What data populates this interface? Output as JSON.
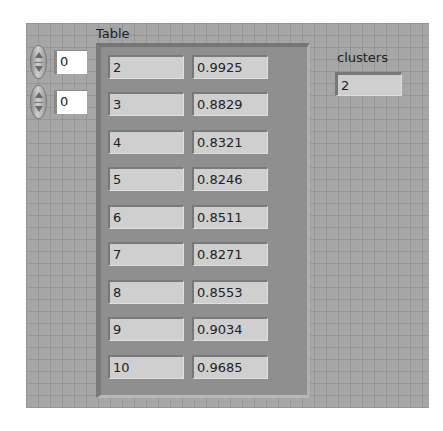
{
  "table": {
    "label": "Table",
    "row_index": "0",
    "col_index": "0",
    "rows": [
      [
        "2",
        "0.9925"
      ],
      [
        "3",
        "0.8829"
      ],
      [
        "4",
        "0.8321"
      ],
      [
        "5",
        "0.8246"
      ],
      [
        "6",
        "0.8511"
      ],
      [
        "7",
        "0.8271"
      ],
      [
        "8",
        "0.8553"
      ],
      [
        "9",
        "0.9034"
      ],
      [
        "10",
        "0.9685"
      ]
    ]
  },
  "clusters": {
    "label": "clusters",
    "value": "2"
  }
}
